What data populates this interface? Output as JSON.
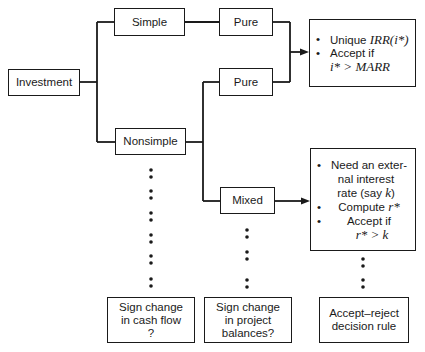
{
  "diagram": {
    "type": "flowchart",
    "nodes": {
      "investment": {
        "label": "Investment"
      },
      "simple": {
        "label": "Simple"
      },
      "nonsimple": {
        "label": "Nonsimple"
      },
      "pure_top": {
        "label": "Pure"
      },
      "pure_mid": {
        "label": "Pure"
      },
      "mixed": {
        "label": "Mixed"
      },
      "pure_outcome": {
        "items": [
          {
            "bullet": "•",
            "text": "Unique ",
            "math": "IRR(i*)"
          },
          {
            "bullet": "•",
            "text": "Accept if",
            "math": "i* > MARR"
          }
        ]
      },
      "mixed_outcome": {
        "items": [
          {
            "bullet": "•",
            "line1": "Need an exter-",
            "line2": "nal interest",
            "line3": "rate (say ",
            "math": "k",
            "close": ")"
          },
          {
            "bullet": "•",
            "text": "Compute ",
            "math": "r*"
          },
          {
            "bullet": "•",
            "text": "Accept if",
            "math": "r* > k"
          }
        ]
      },
      "question_cashflow": {
        "line1": "Sign change",
        "line2": "in cash flow",
        "line3": "?"
      },
      "question_balances": {
        "line1": "Sign change",
        "line2": "in project",
        "line3": "balances?"
      },
      "decision_rule": {
        "line1": "Accept–reject",
        "line2": "decision rule"
      }
    },
    "edges": [
      {
        "from": "investment",
        "to": "simple"
      },
      {
        "from": "investment",
        "to": "nonsimple"
      },
      {
        "from": "simple",
        "to": "pure_top"
      },
      {
        "from": "nonsimple",
        "to": "pure_mid"
      },
      {
        "from": "nonsimple",
        "to": "mixed"
      },
      {
        "from": "pure_top",
        "to": "pure_outcome",
        "arrow": true
      },
      {
        "from": "pure_mid",
        "to": "pure_outcome",
        "arrow": true
      },
      {
        "from": "mixed",
        "to": "mixed_outcome",
        "arrow": true
      }
    ],
    "dotted_links": [
      {
        "from": "nonsimple",
        "to": "question_cashflow"
      },
      {
        "from": "mixed",
        "to": "question_balances"
      },
      {
        "from": "mixed_outcome",
        "to": "decision_rule"
      }
    ]
  }
}
